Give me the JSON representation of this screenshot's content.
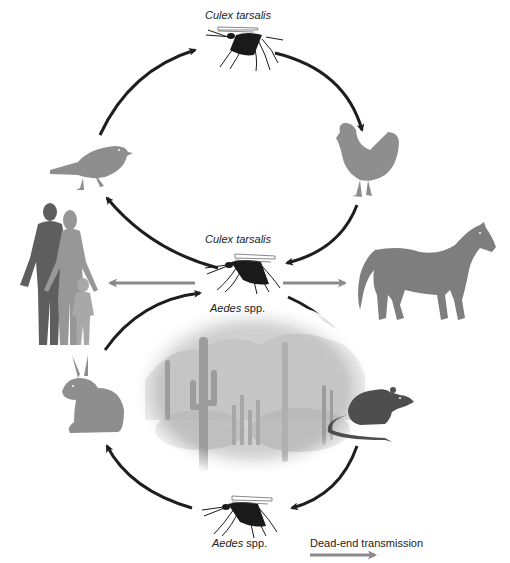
{
  "diagram": {
    "labels": {
      "top_mosquito": {
        "genus_species": "Culex tarsalis",
        "suffix": ""
      },
      "center_mosquito_top": {
        "genus_species": "Culex tarsalis",
        "suffix": ""
      },
      "center_mosquito_bottom": {
        "genus_species": "Aedes",
        "suffix": " spp."
      },
      "bottom_mosquito": {
        "genus_species": "Aedes",
        "suffix": " spp."
      }
    },
    "legend": {
      "label": "Dead-end transmission",
      "arrow_color": "#8a8a8a"
    },
    "cycles": [
      {
        "name": "upper-avian-cycle",
        "nodes": [
          "Culex tarsalis (top)",
          "chicken",
          "Culex tarsalis (center)",
          "songbird"
        ],
        "arrow_color": "#1e1e1e"
      },
      {
        "name": "lower-rodent-cycle",
        "nodes": [
          "Aedes spp. (center)",
          "rat",
          "Aedes spp. (bottom)",
          "rabbit"
        ],
        "arrow_color": "#1e1e1e"
      }
    ],
    "dead_end_hosts": [
      "humans",
      "horse"
    ],
    "center_image": "desert landscape with saguaro cacti",
    "colors": {
      "cycle_arrow": "#1e1e1e",
      "dead_end_arrow": "#8a8a8a",
      "animal_light": "#8e8e8e",
      "animal_dark": "#4e4e4e",
      "mosquito": "#1a1a1a"
    }
  }
}
